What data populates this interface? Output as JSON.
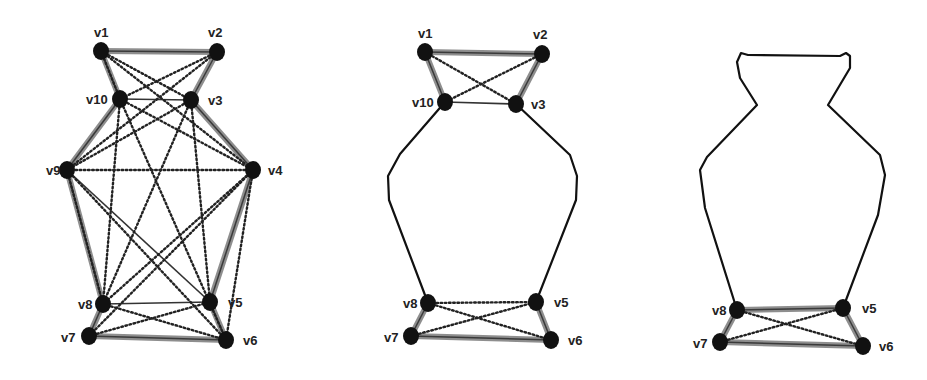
{
  "figure": {
    "colors": {
      "node": "#111111",
      "thick_edge": "#7a7a7a",
      "dotted_edge": "#222222",
      "outline": "#111111"
    },
    "panels": [
      {
        "id": "panel-1",
        "nodes": [
          {
            "id": "v1",
            "label": "v1",
            "x": 101,
            "y": 51,
            "lx": 94,
            "ly": 37
          },
          {
            "id": "v2",
            "label": "v2",
            "x": 217,
            "y": 52,
            "lx": 208,
            "ly": 37
          },
          {
            "id": "v10",
            "label": "v10",
            "x": 120,
            "y": 99,
            "lx": 86,
            "ly": 104
          },
          {
            "id": "v3",
            "label": "v3",
            "x": 191,
            "y": 100,
            "lx": 208,
            "ly": 105
          },
          {
            "id": "v9",
            "label": "v9",
            "x": 67,
            "y": 170,
            "lx": 46,
            "ly": 175
          },
          {
            "id": "v4",
            "label": "v4",
            "x": 253,
            "y": 170,
            "lx": 268,
            "ly": 175
          },
          {
            "id": "v8",
            "label": "v8",
            "x": 103,
            "y": 304,
            "lx": 78,
            "ly": 309
          },
          {
            "id": "v5",
            "label": "v5",
            "x": 210,
            "y": 302,
            "lx": 228,
            "ly": 307
          },
          {
            "id": "v7",
            "label": "v7",
            "x": 89,
            "y": 336,
            "lx": 61,
            "ly": 342
          },
          {
            "id": "v6",
            "label": "v6",
            "x": 226,
            "y": 340,
            "lx": 243,
            "ly": 345
          }
        ],
        "thick_edges": [
          [
            "v1",
            "v2"
          ],
          [
            "v1",
            "v10"
          ],
          [
            "v2",
            "v3"
          ],
          [
            "v10",
            "v9"
          ],
          [
            "v3",
            "v4"
          ],
          [
            "v9",
            "v8"
          ],
          [
            "v4",
            "v5"
          ],
          [
            "v8",
            "v7"
          ],
          [
            "v5",
            "v6"
          ],
          [
            "v7",
            "v6"
          ]
        ],
        "thin_edges": [
          [
            "v10",
            "v3"
          ],
          [
            "v8",
            "v5"
          ],
          [
            "v9",
            "v5"
          ]
        ],
        "dotted_edges": [
          [
            "v1",
            "v3"
          ],
          [
            "v1",
            "v4"
          ],
          [
            "v2",
            "v10"
          ],
          [
            "v2",
            "v9"
          ],
          [
            "v10",
            "v4"
          ],
          [
            "v10",
            "v8"
          ],
          [
            "v10",
            "v6"
          ],
          [
            "v3",
            "v9"
          ],
          [
            "v3",
            "v8"
          ],
          [
            "v3",
            "v5"
          ],
          [
            "v9",
            "v4"
          ],
          [
            "v9",
            "v8"
          ],
          [
            "v9",
            "v6"
          ],
          [
            "v4",
            "v8"
          ],
          [
            "v4",
            "v7"
          ],
          [
            "v4",
            "v6"
          ],
          [
            "v8",
            "v6"
          ],
          [
            "v7",
            "v5"
          ],
          [
            "v1",
            "v10"
          ]
        ]
      },
      {
        "id": "panel-2",
        "nodes": [
          {
            "id": "v1",
            "label": "v1",
            "x": 425,
            "y": 52,
            "lx": 418,
            "ly": 38
          },
          {
            "id": "v2",
            "label": "v2",
            "x": 542,
            "y": 54,
            "lx": 533,
            "ly": 39
          },
          {
            "id": "v10",
            "label": "v10",
            "x": 445,
            "y": 102,
            "lx": 412,
            "ly": 107
          },
          {
            "id": "v3",
            "label": "v3",
            "x": 516,
            "y": 104,
            "lx": 531,
            "ly": 109
          },
          {
            "id": "v8",
            "label": "v8",
            "x": 428,
            "y": 303,
            "lx": 403,
            "ly": 308
          },
          {
            "id": "v5",
            "label": "v5",
            "x": 536,
            "y": 302,
            "lx": 554,
            "ly": 307
          },
          {
            "id": "v7",
            "label": "v7",
            "x": 411,
            "y": 336,
            "lx": 384,
            "ly": 342
          },
          {
            "id": "v6",
            "label": "v6",
            "x": 551,
            "y": 340,
            "lx": 568,
            "ly": 345
          }
        ],
        "thick_edges": [
          [
            "v1",
            "v2"
          ],
          [
            "v1",
            "v10"
          ],
          [
            "v2",
            "v3"
          ],
          [
            "v8",
            "v7"
          ],
          [
            "v5",
            "v6"
          ],
          [
            "v7",
            "v6"
          ]
        ],
        "thin_edges": [
          [
            "v10",
            "v3"
          ]
        ],
        "dotted_edges": [
          [
            "v1",
            "v3"
          ],
          [
            "v2",
            "v10"
          ],
          [
            "v8",
            "v5"
          ],
          [
            "v8",
            "v6"
          ],
          [
            "v7",
            "v5"
          ]
        ],
        "outline_left": "445,102 400,154 388,176 389,200 428,303",
        "outline_right": "516,104 570,155 577,176 576,200 536,302"
      },
      {
        "id": "panel-3",
        "nodes": [
          {
            "id": "v8",
            "label": "v8",
            "x": 737,
            "y": 310,
            "lx": 712,
            "ly": 315
          },
          {
            "id": "v5",
            "label": "v5",
            "x": 843,
            "y": 308,
            "lx": 862,
            "ly": 313
          },
          {
            "id": "v7",
            "label": "v7",
            "x": 720,
            "y": 342,
            "lx": 693,
            "ly": 348
          },
          {
            "id": "v6",
            "label": "v6",
            "x": 863,
            "y": 346,
            "lx": 879,
            "ly": 351
          }
        ],
        "thick_edges": [
          [
            "v8",
            "v7"
          ],
          [
            "v5",
            "v6"
          ],
          [
            "v7",
            "v6"
          ],
          [
            "v8",
            "v5"
          ]
        ],
        "thin_edges": [],
        "dotted_edges": [
          [
            "v8",
            "v6"
          ],
          [
            "v7",
            "v5"
          ]
        ],
        "outline": "737,310 705,208 700,170 707,157 757,105 740,78 737,62 741,53 748,55 840,56 846,53 850,56 850,68 828,105 880,155 885,175 878,215 843,308"
      }
    ]
  }
}
